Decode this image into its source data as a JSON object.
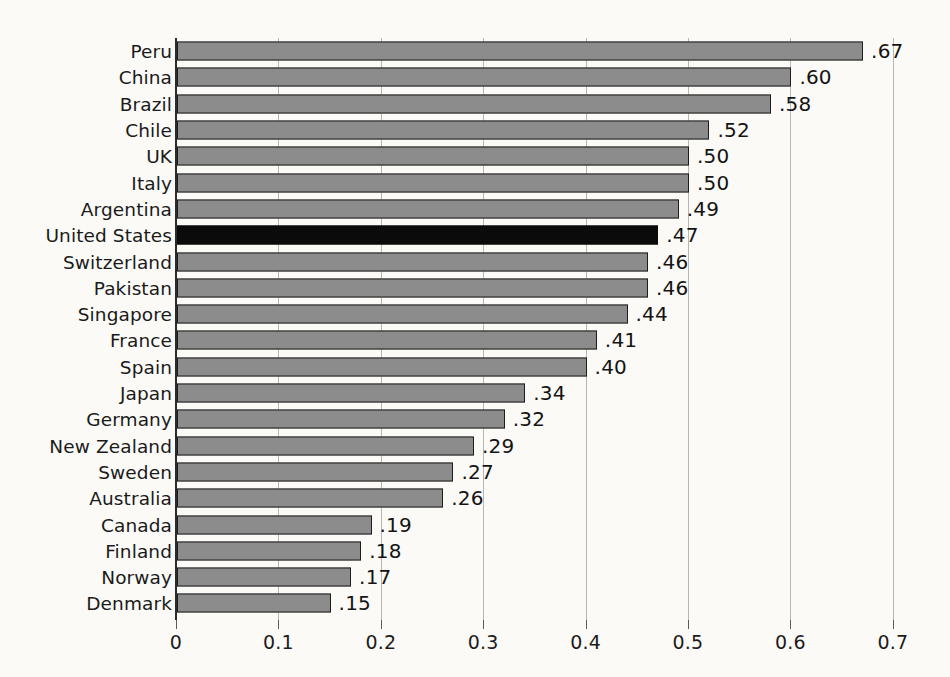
{
  "chart_data": {
    "type": "bar",
    "orientation": "horizontal",
    "title": "",
    "subtitle": "",
    "xlabel": "",
    "ylabel": "",
    "xlim": [
      0,
      0.7
    ],
    "grid": true,
    "legend": null,
    "x_tick_labels": [
      "0",
      "0.1",
      "0.2",
      "0.3",
      "0.4",
      "0.5",
      "0.6",
      "0.7"
    ],
    "x_tick_values": [
      0,
      0.1,
      0.2,
      0.3,
      0.4,
      0.5,
      0.6,
      0.7
    ],
    "categories": [
      "Peru",
      "China",
      "Brazil",
      "Chile",
      "UK",
      "Italy",
      "Argentina",
      "United States",
      "Switzerland",
      "Pakistan",
      "Singapore",
      "France",
      "Spain",
      "Japan",
      "Germany",
      "New Zealand",
      "Sweden",
      "Australia",
      "Canada",
      "Finland",
      "Norway",
      "Denmark"
    ],
    "values": [
      0.67,
      0.6,
      0.58,
      0.52,
      0.5,
      0.5,
      0.49,
      0.47,
      0.46,
      0.46,
      0.44,
      0.41,
      0.4,
      0.34,
      0.32,
      0.29,
      0.27,
      0.26,
      0.19,
      0.18,
      0.17,
      0.15
    ],
    "value_labels": [
      ".67",
      ".60",
      ".58",
      ".52",
      ".50",
      ".50",
      ".49",
      ".47",
      ".46",
      ".46",
      ".44",
      ".41",
      ".40",
      ".34",
      ".32",
      ".29",
      ".27",
      ".26",
      ".19",
      ".18",
      ".17",
      ".15"
    ],
    "highlighted_category": "United States",
    "colors": {
      "bar_fill": "#8c8c8c",
      "bar_outline": "#1d1d1d",
      "highlight_fill": "#0b0b0b",
      "grid": "#b8b6b1",
      "axis": "#2b2b2b",
      "background": "#fbfaf7",
      "text": "#1a1a1a"
    }
  },
  "caption": {
    "text": ""
  }
}
